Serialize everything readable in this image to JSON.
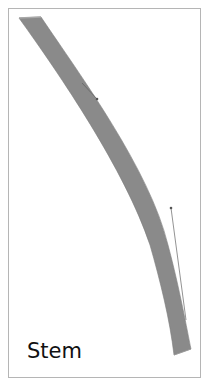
{
  "header": {
    "cut_title": "· ·  ·· ·· ·  · ·"
  },
  "figure": {
    "label": "Stem",
    "colors": {
      "stem_fill": "#8a8a8a",
      "frame_border": "#b5b5b5",
      "handle_line": "#777777",
      "background": "#ffffff"
    }
  }
}
